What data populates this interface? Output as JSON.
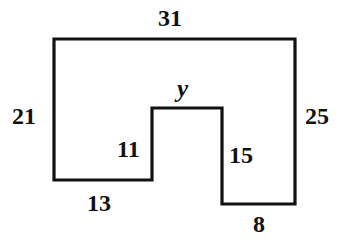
{
  "figure": {
    "type": "geometry-diagram",
    "stroke_color": "#111111",
    "fill_color": "#ffffff",
    "background_color": "#ffffff",
    "stroke_width": 3.2,
    "polygon_points": "54,39 295,39 295,204 222,204 222,108 152,108 152,180 54,180",
    "labels": {
      "top": "31",
      "left": "21",
      "right": "25",
      "notch_top": "y",
      "notch_left": "11",
      "notch_right": "15",
      "bottom_left": "13",
      "bottom_right": "8"
    }
  }
}
